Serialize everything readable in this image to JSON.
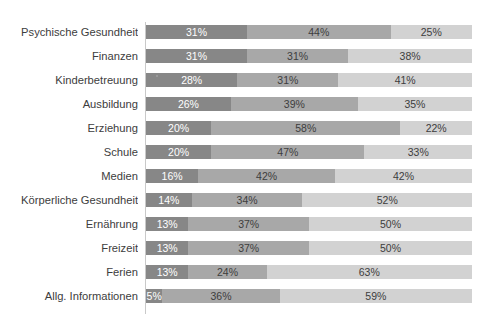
{
  "chart_data": {
    "type": "bar",
    "orientation": "horizontal",
    "stacked": true,
    "stack_mode": "percent",
    "title": "",
    "subtitle": "",
    "xlabel": "",
    "ylabel": "",
    "xlim": [
      0,
      100
    ],
    "grid": false,
    "legend_position": "top",
    "legend_visible": false,
    "legend_note": "legend row is cropped off the top edge of the screenshot and is illegible",
    "value_suffix": "%",
    "categories": [
      "Psychische Gesundheit",
      "Finanzen",
      "Kinderbetreuung",
      "Ausbildung",
      "Erziehung",
      "Schule",
      "Medien",
      "Körperliche Gesundheit",
      "Ernährung",
      "Freizeit",
      "Ferien",
      "Allg. Informationen"
    ],
    "series": [
      {
        "name": "series-1",
        "color": "#878787",
        "label_color": "#ffffff",
        "values": [
          31,
          31,
          28,
          26,
          20,
          20,
          16,
          14,
          13,
          13,
          13,
          5
        ]
      },
      {
        "name": "series-2",
        "color": "#a8a8a8",
        "label_color": "#3d3d3d",
        "values": [
          44,
          31,
          31,
          39,
          58,
          47,
          42,
          34,
          37,
          37,
          24,
          36
        ]
      },
      {
        "name": "series-3",
        "color": "#d2d2d2",
        "label_color": "#3d3d3d",
        "values": [
          25,
          38,
          41,
          35,
          22,
          33,
          42,
          52,
          50,
          50,
          63,
          59
        ]
      }
    ],
    "data_labels": [
      {
        "category": "Psychische Gesundheit",
        "labels": [
          "31%",
          "44%",
          "25%"
        ]
      },
      {
        "category": "Finanzen",
        "labels": [
          "31%",
          "31%",
          "38%"
        ]
      },
      {
        "category": "Kinderbetreuung",
        "labels": [
          "28%",
          "31%",
          "41%"
        ]
      },
      {
        "category": "Ausbildung",
        "labels": [
          "26%",
          "39%",
          "35%"
        ]
      },
      {
        "category": "Erziehung",
        "labels": [
          "20%",
          "58%",
          "22%"
        ]
      },
      {
        "category": "Schule",
        "labels": [
          "20%",
          "47%",
          "33%"
        ]
      },
      {
        "category": "Medien",
        "labels": [
          "16%",
          "42%",
          "42%"
        ]
      },
      {
        "category": "Körperliche Gesundheit",
        "labels": [
          "14%",
          "34%",
          "52%"
        ]
      },
      {
        "category": "Ernährung",
        "labels": [
          "13%",
          "37%",
          "50%"
        ]
      },
      {
        "category": "Freizeit",
        "labels": [
          "13%",
          "37%",
          "50%"
        ]
      },
      {
        "category": "Ferien",
        "labels": [
          "13%",
          "24%",
          "63%"
        ]
      },
      {
        "category": "Allg. Informationen",
        "labels": [
          "5%",
          "36%",
          "59%"
        ]
      }
    ]
  },
  "colors": {
    "series_1": "#878787",
    "series_2": "#a8a8a8",
    "series_3": "#d2d2d2",
    "axis_line": "#c9c9c9",
    "category_text": "#3d3d3d",
    "background": "#ffffff"
  },
  "legend_remnant": {
    "fragments": [
      "",
      "",
      "",
      ""
    ]
  }
}
